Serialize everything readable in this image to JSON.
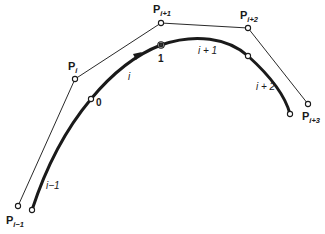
{
  "figure": {
    "control_points": [
      {
        "name": "P",
        "subscript": "i−1"
      },
      {
        "name": "P",
        "subscript": "i"
      },
      {
        "name": "P",
        "subscript": "i+1"
      },
      {
        "name": "P",
        "subscript": "i+2"
      },
      {
        "name": "P",
        "subscript": "i+3"
      }
    ],
    "segment_labels": [
      "i−1",
      "i",
      "i + 1",
      "i + 2"
    ],
    "parameter_labels": [
      "0",
      "1"
    ],
    "colors": {
      "ink": "#1a1a1a",
      "background": "#ffffff"
    }
  }
}
